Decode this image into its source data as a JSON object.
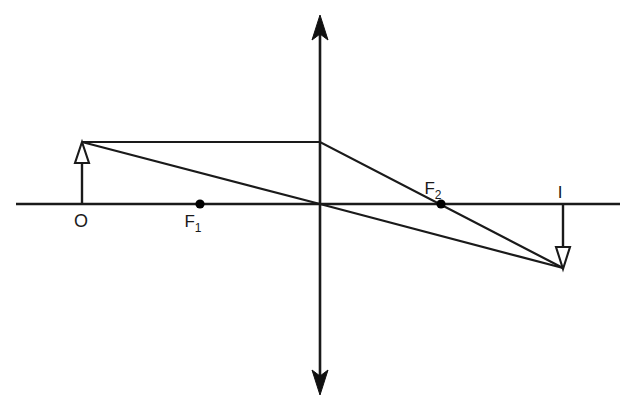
{
  "diagram": {
    "type": "optics-ray-diagram",
    "background_color": "#ffffff",
    "stroke_color": "#1a1a1a",
    "labels": {
      "object": "O",
      "focal_near": "F",
      "focal_near_sub": "1",
      "focal_far": "F",
      "focal_far_sub": "2",
      "image": "I"
    },
    "geometry": {
      "principal_axis": {
        "x1": 16,
        "y1": 204,
        "x2": 620,
        "y2": 204
      },
      "lens_axis": {
        "x": 320,
        "y_top": 18,
        "y_bottom": 392
      },
      "lens_center": {
        "x": 320,
        "y": 204
      },
      "object": {
        "x": 82,
        "base_y": 204,
        "tip_y": 142,
        "direction": "up",
        "arrowhead": "hollow"
      },
      "image": {
        "x": 563,
        "base_y": 204,
        "tip_y": 268,
        "direction": "down",
        "arrowhead": "hollow"
      },
      "focal_point_1": {
        "x": 200,
        "y": 204
      },
      "focal_point_2": {
        "x": 441,
        "y": 204
      },
      "ray_parallel": {
        "name": "parallel-ray-through-focus",
        "points": "82,142 320,142 563,268"
      },
      "ray_center": {
        "name": "undeviated-center-ray",
        "points": "82,142 320,204 563,268"
      }
    },
    "label_positions": {
      "object": {
        "x": 81,
        "y": 227
      },
      "focal_1": {
        "x": 193,
        "y": 227
      },
      "focal_2": {
        "x": 433,
        "y": 194
      },
      "image": {
        "x": 560,
        "y": 198
      }
    }
  }
}
